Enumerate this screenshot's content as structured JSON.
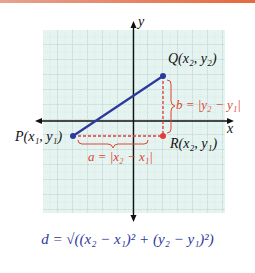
{
  "diagram": {
    "colors": {
      "accent_bar": "#e46a3e",
      "grid_fill": "#e6f4f1",
      "grid_line": "#9fb8b4",
      "axis": "#111111",
      "segment": "#2b3a9c",
      "point_blue": "#2b3a9c",
      "point_red": "#e03a3a",
      "dashed": "#e03a3a",
      "label_red": "#e0452f",
      "formula": "#2e3a9a"
    },
    "axes": {
      "x_label": "x",
      "y_label": "y"
    },
    "points": {
      "P": {
        "label": "P(x₁, y₁)",
        "color": "blue"
      },
      "Q": {
        "label": "Q(x₂, y₂)",
        "color": "blue"
      },
      "R": {
        "label": "R(x₂, y₁)",
        "color": "red"
      }
    },
    "braces": {
      "horizontal": "a = |x₂ − x₁|",
      "vertical": "b = |y₂ − y₁|"
    },
    "formula": "d = √((x₂ − x₁)² + (y₂ − y₁)²)"
  }
}
